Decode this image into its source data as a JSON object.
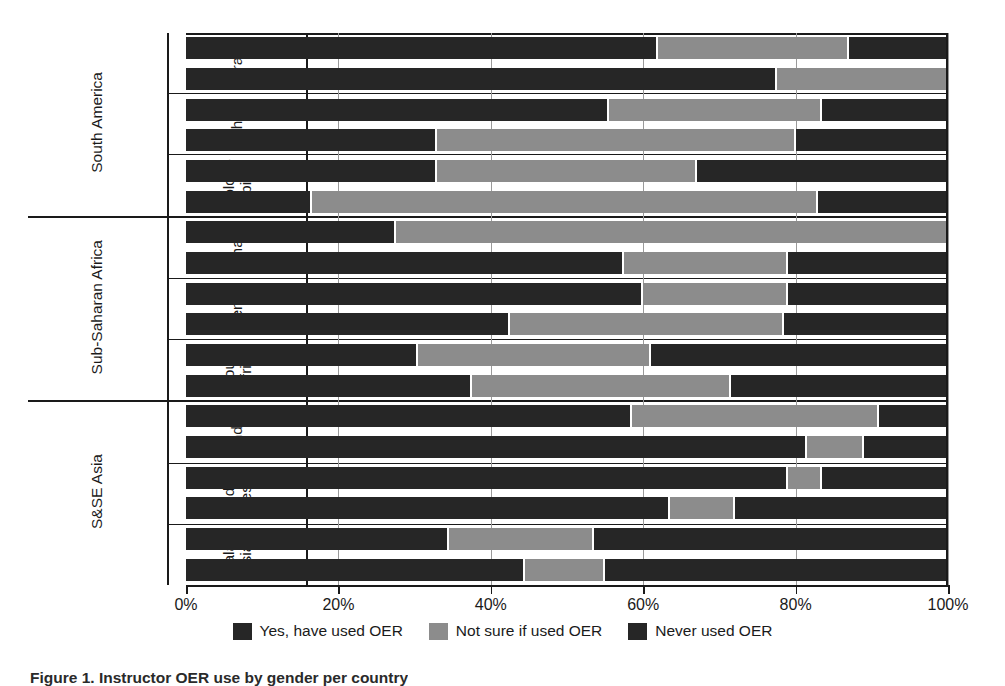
{
  "caption": "Figure 1. Instructor OER use by gender per country",
  "legend": {
    "position": "bottom-center",
    "items": [
      {
        "label": "Yes, have used OER",
        "color": "#262626"
      },
      {
        "label": "Not sure if used OER",
        "color": "#8c8c8c"
      },
      {
        "label": "Never used OER",
        "color": "#262626"
      }
    ]
  },
  "axis": {
    "ticks": [
      "0%",
      "20%",
      "40%",
      "60%",
      "80%",
      "100%"
    ],
    "tick_values": [
      0,
      20,
      40,
      60,
      80,
      100
    ],
    "min": 0,
    "max": 100
  },
  "regions": [
    {
      "name": "South America",
      "countries": [
        {
          "name": "Brazil",
          "display": "Brazil",
          "two_line": false
        },
        {
          "name": "Chile",
          "display": "Chile",
          "two_line": false
        },
        {
          "name": "Colombia",
          "display": "Colom-\nbia",
          "two_line": true
        }
      ]
    },
    {
      "name": "Sub-Saharan Africa",
      "countries": [
        {
          "name": "Ghana",
          "display": "Ghana",
          "two_line": false
        },
        {
          "name": "Kenya",
          "display": "Kenya",
          "two_line": false
        },
        {
          "name": "South Africa",
          "display": "South\nAfrica",
          "two_line": true
        }
      ]
    },
    {
      "name": "S&SE Asia",
      "countries": [
        {
          "name": "India",
          "display": "India",
          "two_line": false
        },
        {
          "name": "Indonesia",
          "display": "Indo-\nnesia",
          "two_line": true
        },
        {
          "name": "Malaysia",
          "display": "Malay-\nsia",
          "two_line": true
        }
      ]
    }
  ],
  "gender_labels": {
    "female": "Female",
    "male": "Male"
  },
  "chart_data": {
    "type": "bar",
    "orientation": "horizontal",
    "stacked": true,
    "normalized_percent": true,
    "title": "Instructor OER use by gender per country",
    "xlabel": "",
    "ylabel": "",
    "xlim": [
      0,
      100
    ],
    "xticks": [
      0,
      20,
      40,
      60,
      80,
      100
    ],
    "xticklabels": [
      "0%",
      "20%",
      "40%",
      "60%",
      "80%",
      "100%"
    ],
    "grid": true,
    "legend_position": "bottom-center",
    "series": [
      {
        "name": "Yes, have used OER",
        "color": "#262626"
      },
      {
        "name": "Not sure if used OER",
        "color": "#8c8c8c"
      },
      {
        "name": "Never used OER",
        "color": "#262626"
      }
    ],
    "categories": [
      "Brazil Female",
      "Brazil Male",
      "Chile Female",
      "Chile Male",
      "Colombia Female",
      "Colombia Male",
      "Ghana Female",
      "Ghana Male",
      "Kenya Female",
      "Kenya Male",
      "South Africa Female",
      "South Africa Male",
      "India Female",
      "India Male",
      "Indonesia Female",
      "Indonesia Male",
      "Malaysia Female",
      "Malaysia Male"
    ],
    "rows": [
      {
        "region": "South America",
        "country": "Brazil",
        "gender": "Female",
        "values": [
          62.0,
          25.0,
          13.0
        ]
      },
      {
        "region": "South America",
        "country": "Brazil",
        "gender": "Male",
        "values": [
          77.5,
          22.5,
          0.0
        ]
      },
      {
        "region": "South America",
        "country": "Chile",
        "gender": "Female",
        "values": [
          55.5,
          28.0,
          16.5
        ]
      },
      {
        "region": "South America",
        "country": "Chile",
        "gender": "Male",
        "values": [
          33.0,
          47.0,
          20.0
        ]
      },
      {
        "region": "South America",
        "country": "Colombia",
        "gender": "Female",
        "values": [
          33.0,
          34.0,
          33.0
        ]
      },
      {
        "region": "South America",
        "country": "Colombia",
        "gender": "Male",
        "values": [
          16.5,
          66.5,
          17.0
        ]
      },
      {
        "region": "Sub-Saharan Africa",
        "country": "Ghana",
        "gender": "Female",
        "values": [
          27.5,
          72.5,
          0.0
        ]
      },
      {
        "region": "Sub-Saharan Africa",
        "country": "Ghana",
        "gender": "Male",
        "values": [
          57.5,
          21.5,
          21.0
        ]
      },
      {
        "region": "Sub-Saharan Africa",
        "country": "Kenya",
        "gender": "Female",
        "values": [
          60.0,
          19.0,
          21.0
        ]
      },
      {
        "region": "Sub-Saharan Africa",
        "country": "Kenya",
        "gender": "Male",
        "values": [
          42.5,
          36.0,
          21.5
        ]
      },
      {
        "region": "Sub-Saharan Africa",
        "country": "South Africa",
        "gender": "Female",
        "values": [
          30.5,
          30.5,
          39.0
        ]
      },
      {
        "region": "Sub-Saharan Africa",
        "country": "South Africa",
        "gender": "Male",
        "values": [
          37.5,
          34.0,
          28.5
        ]
      },
      {
        "region": "S&SE Asia",
        "country": "India",
        "gender": "Female",
        "values": [
          58.5,
          32.5,
          9.0
        ]
      },
      {
        "region": "S&SE Asia",
        "country": "India",
        "gender": "Male",
        "values": [
          81.5,
          7.5,
          11.0
        ]
      },
      {
        "region": "S&SE Asia",
        "country": "Indonesia",
        "gender": "Female",
        "values": [
          79.0,
          4.5,
          16.5
        ]
      },
      {
        "region": "S&SE Asia",
        "country": "Indonesia",
        "gender": "Male",
        "values": [
          63.5,
          8.5,
          28.0
        ]
      },
      {
        "region": "S&SE Asia",
        "country": "Malaysia",
        "gender": "Female",
        "values": [
          34.5,
          19.0,
          46.5
        ]
      },
      {
        "region": "S&SE Asia",
        "country": "Malaysia",
        "gender": "Male",
        "values": [
          44.5,
          10.5,
          45.0
        ]
      }
    ]
  }
}
